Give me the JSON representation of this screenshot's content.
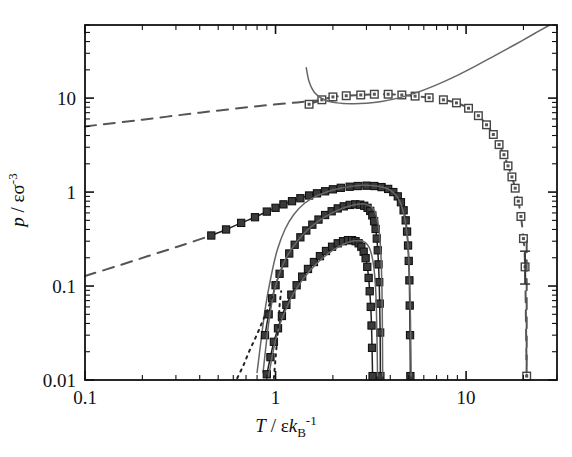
{
  "chart_data": {
    "type": "line",
    "title": "",
    "xlabel": "T / εk_B^-1",
    "ylabel": "p / εσ^-3",
    "xscale": "log",
    "yscale": "log",
    "xlim": [
      0.1,
      30
    ],
    "ylim": [
      0.01,
      60
    ],
    "grid": false,
    "legend": "none",
    "xticks": [
      0.1,
      1,
      10
    ],
    "xticklabels": [
      "0.1",
      "1",
      "10"
    ],
    "yticks": [
      0.01,
      0.1,
      1,
      10
    ],
    "yticklabels": [
      "0.01",
      "0.1",
      "1",
      "10"
    ],
    "series": [
      {
        "name": "upper-dashed-line",
        "style": "dashed",
        "marker": "none",
        "color": "#555555",
        "points": [
          [
            0.1,
            5.0
          ],
          [
            0.2,
            5.9
          ],
          [
            0.4,
            7.0
          ],
          [
            0.8,
            8.2
          ],
          [
            1.3,
            9.0
          ],
          [
            1.7,
            9.5
          ]
        ]
      },
      {
        "name": "upper-branch-markers",
        "style": "dashed",
        "marker": "open-square",
        "color": "#555555",
        "points": [
          [
            1.5,
            8.6
          ],
          [
            1.75,
            9.6
          ],
          [
            2.0,
            10.3
          ],
          [
            2.35,
            10.6
          ],
          [
            2.8,
            10.8
          ],
          [
            3.3,
            11.0
          ],
          [
            3.9,
            11.0
          ],
          [
            4.6,
            10.8
          ],
          [
            5.4,
            10.5
          ],
          [
            6.4,
            10.1
          ],
          [
            7.6,
            9.6
          ],
          [
            8.9,
            8.9
          ],
          [
            10.3,
            7.8
          ],
          [
            11.6,
            6.5
          ],
          [
            12.8,
            5.2
          ],
          [
            13.9,
            4.1
          ],
          [
            14.9,
            3.2
          ],
          [
            15.8,
            2.5
          ],
          [
            16.6,
            1.9
          ],
          [
            17.4,
            1.45
          ],
          [
            18.1,
            1.1
          ],
          [
            18.8,
            0.8
          ],
          [
            19.4,
            0.55
          ],
          [
            20.0,
            0.32
          ],
          [
            20.4,
            0.16
          ],
          [
            20.8,
            0.011
          ]
        ]
      },
      {
        "name": "upper-solid-theory",
        "style": "solid",
        "marker": "none",
        "color": "#666666",
        "points": [
          [
            1.45,
            21.0
          ],
          [
            1.5,
            15.0
          ],
          [
            1.6,
            11.5
          ],
          [
            1.8,
            9.6
          ],
          [
            2.1,
            8.9
          ],
          [
            2.5,
            8.7
          ],
          [
            3.0,
            8.8
          ],
          [
            3.6,
            9.2
          ],
          [
            4.4,
            10.0
          ],
          [
            5.4,
            11.3
          ],
          [
            6.8,
            13.5
          ],
          [
            8.5,
            16.5
          ],
          [
            11.0,
            21.5
          ],
          [
            14.0,
            28.0
          ],
          [
            18.0,
            37.0
          ],
          [
            23.0,
            49.0
          ],
          [
            27.5,
            60.0
          ]
        ]
      },
      {
        "name": "lower-dashed-line",
        "style": "dashed",
        "marker": "none",
        "color": "#555555",
        "points": [
          [
            0.1,
            0.128
          ],
          [
            0.15,
            0.165
          ],
          [
            0.22,
            0.212
          ],
          [
            0.32,
            0.27
          ],
          [
            0.45,
            0.34
          ]
        ]
      },
      {
        "name": "large-dome-markers",
        "style": "solid-with-markers",
        "marker": "filled-square",
        "color": "#222222",
        "points": [
          [
            0.46,
            0.345
          ],
          [
            0.55,
            0.4
          ],
          [
            0.66,
            0.47
          ],
          [
            0.78,
            0.54
          ],
          [
            0.9,
            0.62
          ],
          [
            1.0,
            0.68
          ],
          [
            1.1,
            0.74
          ],
          [
            1.22,
            0.8
          ],
          [
            1.35,
            0.86
          ],
          [
            1.5,
            0.92
          ],
          [
            1.65,
            0.97
          ],
          [
            1.82,
            1.02
          ],
          [
            2.0,
            1.07
          ],
          [
            2.2,
            1.11
          ],
          [
            2.45,
            1.14
          ],
          [
            2.7,
            1.16
          ],
          [
            3.0,
            1.17
          ],
          [
            3.3,
            1.16
          ],
          [
            3.6,
            1.13
          ],
          [
            3.9,
            1.08
          ],
          [
            4.15,
            1.0
          ],
          [
            4.38,
            0.9
          ],
          [
            4.55,
            0.78
          ],
          [
            4.7,
            0.64
          ],
          [
            4.82,
            0.5
          ],
          [
            4.9,
            0.38
          ],
          [
            4.96,
            0.27
          ],
          [
            5.0,
            0.185
          ],
          [
            5.04,
            0.115
          ],
          [
            5.06,
            0.062
          ],
          [
            5.08,
            0.03
          ],
          [
            5.1,
            0.011
          ]
        ]
      },
      {
        "name": "large-dome-solid-theory",
        "style": "solid",
        "marker": "none",
        "color": "#666666",
        "points": [
          [
            0.8,
            0.012
          ],
          [
            0.88,
            0.055
          ],
          [
            0.95,
            0.13
          ],
          [
            1.02,
            0.24
          ],
          [
            1.12,
            0.4
          ],
          [
            1.25,
            0.58
          ],
          [
            1.42,
            0.76
          ],
          [
            1.62,
            0.9
          ],
          [
            1.85,
            1.0
          ],
          [
            2.15,
            1.09
          ],
          [
            2.5,
            1.15
          ],
          [
            2.9,
            1.18
          ],
          [
            3.3,
            1.17
          ],
          [
            3.7,
            1.12
          ],
          [
            4.05,
            1.03
          ],
          [
            4.35,
            0.89
          ],
          [
            4.58,
            0.72
          ],
          [
            4.76,
            0.53
          ],
          [
            4.9,
            0.35
          ],
          [
            5.0,
            0.2
          ],
          [
            5.07,
            0.09
          ],
          [
            5.12,
            0.03
          ],
          [
            5.15,
            0.011
          ]
        ]
      },
      {
        "name": "middle-dome-markers",
        "style": "solid-with-markers",
        "marker": "filled-square",
        "color": "#222222",
        "points": [
          [
            0.88,
            0.03
          ],
          [
            0.92,
            0.05
          ],
          [
            0.96,
            0.074
          ],
          [
            1.0,
            0.102
          ],
          [
            1.05,
            0.135
          ],
          [
            1.11,
            0.175
          ],
          [
            1.18,
            0.222
          ],
          [
            1.26,
            0.275
          ],
          [
            1.35,
            0.33
          ],
          [
            1.45,
            0.39
          ],
          [
            1.56,
            0.45
          ],
          [
            1.68,
            0.51
          ],
          [
            1.82,
            0.57
          ],
          [
            1.97,
            0.625
          ],
          [
            2.12,
            0.67
          ],
          [
            2.28,
            0.705
          ],
          [
            2.45,
            0.73
          ],
          [
            2.62,
            0.74
          ],
          [
            2.78,
            0.735
          ],
          [
            2.92,
            0.715
          ],
          [
            3.04,
            0.68
          ],
          [
            3.14,
            0.63
          ],
          [
            3.22,
            0.565
          ],
          [
            3.29,
            0.49
          ],
          [
            3.35,
            0.405
          ],
          [
            3.4,
            0.32
          ],
          [
            3.44,
            0.24
          ],
          [
            3.47,
            0.17
          ],
          [
            3.5,
            0.11
          ],
          [
            3.52,
            0.065
          ],
          [
            3.54,
            0.032
          ],
          [
            3.55,
            0.011
          ]
        ]
      },
      {
        "name": "middle-dome-solid-theory",
        "style": "solid",
        "marker": "none",
        "color": "#666666",
        "points": [
          [
            0.86,
            0.012
          ],
          [
            0.92,
            0.04
          ],
          [
            0.98,
            0.085
          ],
          [
            1.06,
            0.145
          ],
          [
            1.16,
            0.215
          ],
          [
            1.3,
            0.3
          ],
          [
            1.48,
            0.4
          ],
          [
            1.7,
            0.5
          ],
          [
            1.95,
            0.59
          ],
          [
            2.22,
            0.665
          ],
          [
            2.5,
            0.72
          ],
          [
            2.78,
            0.748
          ],
          [
            3.0,
            0.74
          ],
          [
            3.18,
            0.7
          ],
          [
            3.32,
            0.62
          ],
          [
            3.42,
            0.51
          ],
          [
            3.5,
            0.38
          ],
          [
            3.56,
            0.25
          ],
          [
            3.6,
            0.14
          ],
          [
            3.63,
            0.06
          ],
          [
            3.65,
            0.011
          ]
        ]
      },
      {
        "name": "small-dome-markers",
        "style": "solid-with-markers",
        "marker": "filled-square",
        "color": "#222222",
        "points": [
          [
            0.9,
            0.0115
          ],
          [
            0.94,
            0.0175
          ],
          [
            0.98,
            0.0255
          ],
          [
            1.03,
            0.0355
          ],
          [
            1.08,
            0.048
          ],
          [
            1.14,
            0.063
          ],
          [
            1.21,
            0.081
          ],
          [
            1.29,
            0.102
          ],
          [
            1.38,
            0.126
          ],
          [
            1.48,
            0.152
          ],
          [
            1.59,
            0.18
          ],
          [
            1.71,
            0.208
          ],
          [
            1.84,
            0.236
          ],
          [
            1.98,
            0.262
          ],
          [
            2.12,
            0.285
          ],
          [
            2.26,
            0.3
          ],
          [
            2.4,
            0.308
          ],
          [
            2.52,
            0.308
          ],
          [
            2.63,
            0.3
          ],
          [
            2.73,
            0.285
          ],
          [
            2.82,
            0.262
          ],
          [
            2.9,
            0.232
          ],
          [
            2.97,
            0.198
          ],
          [
            3.03,
            0.16
          ],
          [
            3.08,
            0.122
          ],
          [
            3.12,
            0.088
          ],
          [
            3.16,
            0.06
          ],
          [
            3.19,
            0.038
          ],
          [
            3.21,
            0.022
          ],
          [
            3.23,
            0.011
          ]
        ]
      },
      {
        "name": "small-dome-solid-theory",
        "style": "solid",
        "marker": "none",
        "color": "#666666",
        "points": [
          [
            0.92,
            0.011
          ],
          [
            0.98,
            0.022
          ],
          [
            1.05,
            0.038
          ],
          [
            1.14,
            0.058
          ],
          [
            1.25,
            0.085
          ],
          [
            1.4,
            0.12
          ],
          [
            1.58,
            0.16
          ],
          [
            1.8,
            0.205
          ],
          [
            2.05,
            0.248
          ],
          [
            2.3,
            0.282
          ],
          [
            2.55,
            0.302
          ],
          [
            2.78,
            0.305
          ],
          [
            2.96,
            0.29
          ],
          [
            3.1,
            0.258
          ],
          [
            3.2,
            0.212
          ],
          [
            3.28,
            0.158
          ],
          [
            3.34,
            0.105
          ],
          [
            3.38,
            0.06
          ],
          [
            3.41,
            0.025
          ],
          [
            3.43,
            0.011
          ]
        ]
      },
      {
        "name": "dotted-guide-left",
        "style": "dotted",
        "marker": "none",
        "color": "#222222",
        "points": [
          [
            0.63,
            0.0105
          ],
          [
            0.68,
            0.0145
          ],
          [
            0.73,
            0.0205
          ],
          [
            0.79,
            0.029
          ],
          [
            0.85,
            0.041
          ],
          [
            0.91,
            0.057
          ],
          [
            0.96,
            0.077
          ]
        ]
      },
      {
        "name": "dotted-guide-right",
        "style": "dotted",
        "marker": "none",
        "color": "#222222",
        "points": [
          [
            0.98,
            0.0105
          ],
          [
            1.0,
            0.017
          ],
          [
            1.02,
            0.027
          ],
          [
            1.04,
            0.042
          ],
          [
            1.05,
            0.062
          ],
          [
            1.07,
            0.088
          ]
        ]
      },
      {
        "name": "critical-point-dashed-vertical",
        "style": "dashed",
        "marker": "none",
        "color": "#555555",
        "points": [
          [
            20.8,
            0.3
          ],
          [
            20.8,
            0.011
          ]
        ]
      }
    ],
    "errorbars": [
      {
        "x": 20.4,
        "y": 0.155,
        "ylow": 0.105,
        "yhigh": 0.235
      }
    ]
  }
}
